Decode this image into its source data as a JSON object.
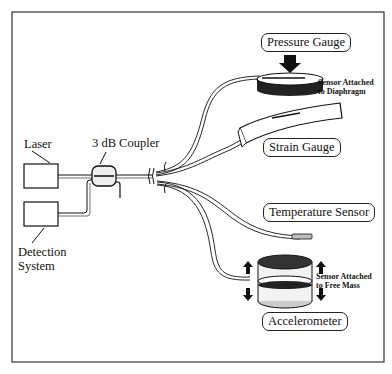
{
  "diagram": {
    "type": "fiber-optic sensor system schematic",
    "components": {
      "laser": "Laser",
      "coupler": "3 dB Coupler",
      "detection_line1": "Detection",
      "detection_line2": "System"
    },
    "sensors": {
      "pressure": "Pressure Gauge",
      "pressure_note_line1": "Sensor Attached",
      "pressure_note_line2": "to Diaphragm",
      "strain": "Strain Gauge",
      "temperature": "Temperature Sensor",
      "accelerometer": "Accelerometer",
      "accel_note_line1": "Sensor Attached",
      "accel_note_line2": "to Free Mass"
    }
  }
}
